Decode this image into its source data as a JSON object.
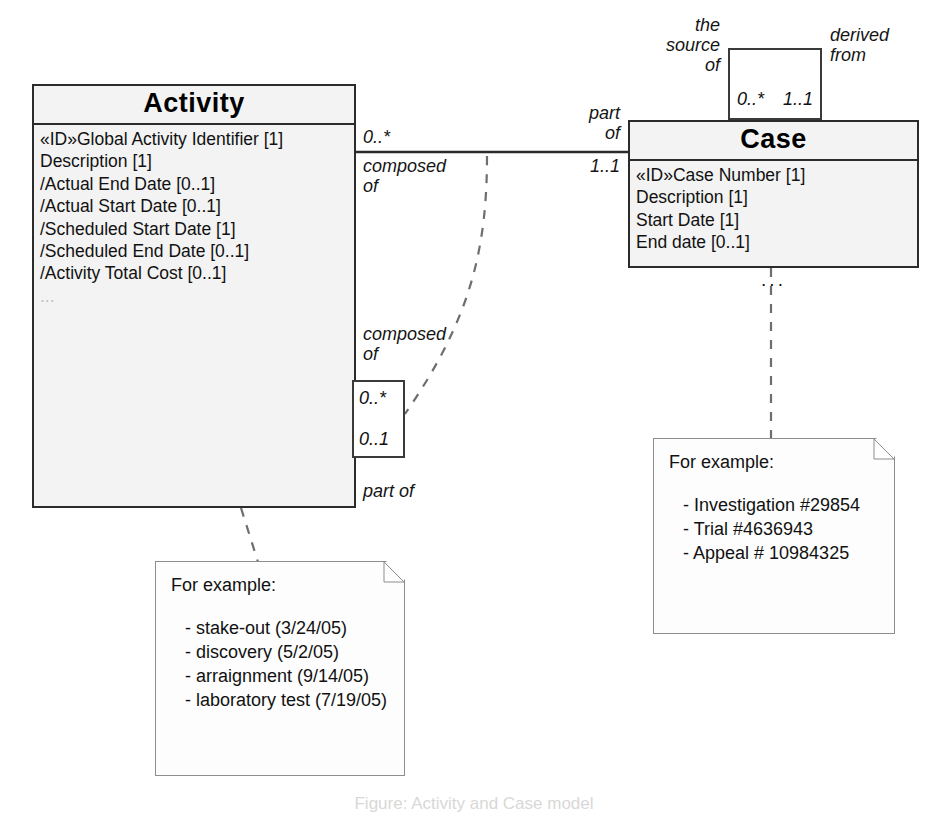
{
  "diagram": {
    "type": "uml-class-diagram",
    "caption": "Figure: Activity and Case model"
  },
  "classes": {
    "activity": {
      "name": "Activity",
      "attributes": [
        "«ID»Global Activity Identifier [1]",
        "Description [1]",
        "/Actual End Date [0..1]",
        "/Actual Start Date [0..1]",
        "/Scheduled Start Date [1]",
        "/Scheduled End Date [0..1]",
        "/Activity Total Cost [0..1]"
      ],
      "trailing": "..."
    },
    "case": {
      "name": "Case",
      "attributes": [
        "«ID»Case Number [1]",
        "Description [1]",
        "Start Date [1]",
        "End date [0..1]"
      ],
      "trailing": "..."
    }
  },
  "associations": {
    "activity_case": {
      "source_mult": "0..*",
      "source_role": "composed\nof",
      "target_role": "part\nof",
      "target_mult": "1..1"
    },
    "activity_self": {
      "role_top": "composed\nof",
      "mult_top": "0..*",
      "mult_bottom": "0..1",
      "role_bottom": "part of"
    },
    "case_derived": {
      "left_label": "the\nsource\nof",
      "right_label": "derived\nfrom",
      "left_mult": "0..*",
      "right_mult": "1..1"
    }
  },
  "notes": {
    "activity_note": {
      "heading": "For example:",
      "items": [
        "- stake-out (3/24/05)",
        "- discovery (5/2/05)",
        "- arraignment (9/14/05)",
        "- laboratory test (7/19/05)"
      ]
    },
    "case_note": {
      "heading": "For example:",
      "items": [
        "- Investigation #29854",
        "- Trial #4636943",
        "- Appeal # 10984325"
      ]
    }
  },
  "colors": {
    "class_fill": "#f3f3f3",
    "class_border": "#2b2b2b",
    "note_border": "#8d8d8d",
    "dash_line": "#6e6e6e"
  }
}
